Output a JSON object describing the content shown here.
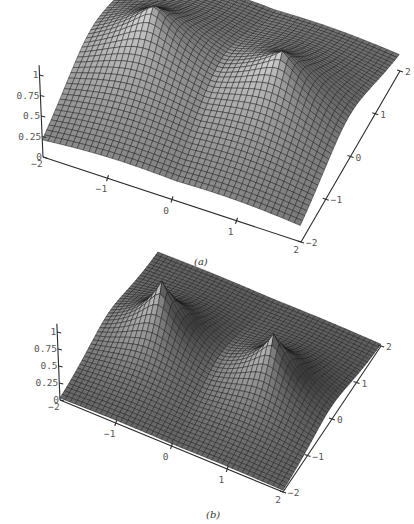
{
  "chart_data": [
    {
      "type": "surface",
      "id": "a",
      "caption": "(a)",
      "title": "",
      "xlabel": "",
      "ylabel": "",
      "zlabel": "",
      "x_range": [
        -2,
        2
      ],
      "y_range": [
        -2,
        2
      ],
      "z_range": [
        0,
        1
      ],
      "x_ticks": [
        "-2",
        "-1",
        "0",
        "1",
        "2"
      ],
      "y_ticks": [
        "-2",
        "-1",
        "0",
        "1",
        "2"
      ],
      "z_ticks": [
        "0",
        "0.25",
        "0.5",
        "0.75",
        "1"
      ],
      "grid": false,
      "description": "Broad two-centre surface with smooth peaks near (x=-1, y=0) and (x=1, y=0), height ~1, falling to ~0.1 at corners",
      "peaks": [
        {
          "x": -1,
          "y": 0,
          "z": 1.0
        },
        {
          "x": 1,
          "y": 0,
          "z": 0.95
        }
      ],
      "decay": 0.75,
      "projection": {
        "origin": [
          43,
          157
        ],
        "ux": [
          64.5,
          21.25
        ],
        "uy": [
          24.75,
          -42.75
        ],
        "uz": [
          -3.5,
          -82
        ]
      }
    },
    {
      "type": "surface",
      "id": "b",
      "caption": "(b)",
      "title": "",
      "xlabel": "",
      "ylabel": "",
      "zlabel": "",
      "x_range": [
        -2,
        2
      ],
      "y_range": [
        -2,
        2
      ],
      "z_range": [
        0,
        1
      ],
      "x_ticks": [
        "-2",
        "-1",
        "0",
        "1",
        "2"
      ],
      "y_ticks": [
        "-2",
        "-1",
        "0",
        "1",
        "2"
      ],
      "z_ticks": [
        "0",
        "0.25",
        "0.5",
        "0.75",
        "1"
      ],
      "grid": false,
      "description": "Sharper two-centre surface with cusp-like peaks near (x=-1, y=0) and (x=1, y=0), height ~1, falling close to 0 at edges",
      "peaks": [
        {
          "x": -1,
          "y": 0,
          "z": 1.0
        },
        {
          "x": 1,
          "y": 0,
          "z": 0.9
        }
      ],
      "decay": 1.6,
      "projection": {
        "origin": [
          60,
          400
        ],
        "ux": [
          55.75,
          23
        ],
        "uy": [
          24.5,
          -36.5
        ],
        "uz": [
          -2.8,
          -68
        ]
      }
    }
  ],
  "figure": {
    "captions": [
      "(a)",
      "(b)"
    ]
  }
}
